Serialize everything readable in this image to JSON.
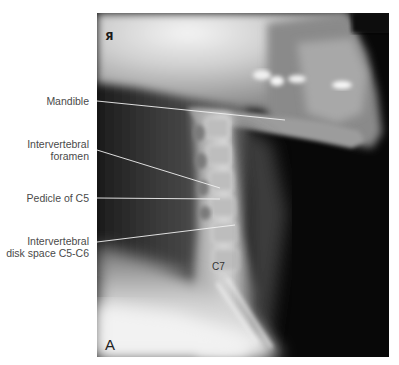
{
  "figure": {
    "panel_letter": "A",
    "side_marker": "R",
    "side_marker_glyph": "Я",
    "image_type": "lateral cervical spine radiograph",
    "vertebra_label": "C7",
    "callouts": [
      {
        "id": "mandible",
        "lines": [
          "Mandible"
        ]
      },
      {
        "id": "intervertebral-foramen",
        "lines": [
          "Intervertebral",
          "foramen"
        ]
      },
      {
        "id": "pedicle-c5",
        "lines": [
          "Pedicle of C5"
        ]
      },
      {
        "id": "disk-space",
        "lines": [
          "Intervertebral",
          "disk space C5-C6"
        ]
      }
    ],
    "colors": {
      "background": "#ffffff",
      "label_text": "#4a4a4a",
      "leader_line": "#f2f2f2",
      "film_dark": "#0a0a0a",
      "bone_light": "#e8e8e8"
    }
  }
}
